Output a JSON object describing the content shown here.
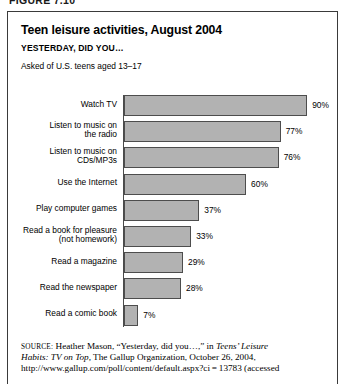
{
  "figure_number": "FIGURE 7.10",
  "figure": {
    "title": "Teen leisure activities, August 2004",
    "subtitle": "YESTERDAY, DID YOU…",
    "asked_note": "Asked of U.S. teens aged 13–17"
  },
  "chart_data": {
    "type": "bar",
    "orientation": "horizontal",
    "title": "Teen leisure activities, August 2004",
    "subtitle": "YESTERDAY, DID YOU…",
    "xlabel": "",
    "ylabel": "",
    "xlim": [
      0,
      100
    ],
    "grid": false,
    "legend": null,
    "value_suffix": "%",
    "categories": [
      "Watch TV",
      "Listen to music on the radio",
      "Listen to music on CDs/MP3s",
      "Use the Internet",
      "Play computer games",
      "Read a book for pleasure (not homework)",
      "Read a magazine",
      "Read the newspaper",
      "Read a comic book"
    ],
    "values": [
      90,
      77,
      76,
      60,
      37,
      33,
      29,
      28,
      7
    ],
    "bars": [
      {
        "label_lines": [
          "Watch TV"
        ],
        "value": 90,
        "value_label": "90%"
      },
      {
        "label_lines": [
          "Listen to music on",
          "the radio"
        ],
        "value": 77,
        "value_label": "77%"
      },
      {
        "label_lines": [
          "Listen to music on",
          "CDs/MP3s"
        ],
        "value": 76,
        "value_label": "76%"
      },
      {
        "label_lines": [
          "Use the Internet"
        ],
        "value": 60,
        "value_label": "60%"
      },
      {
        "label_lines": [
          "Play computer games"
        ],
        "value": 37,
        "value_label": "37%"
      },
      {
        "label_lines": [
          "Read a book for pleasure",
          "(not homework)"
        ],
        "value": 33,
        "value_label": "33%"
      },
      {
        "label_lines": [
          "Read a magazine"
        ],
        "value": 29,
        "value_label": "29%"
      },
      {
        "label_lines": [
          "Read the newspaper"
        ],
        "value": 28,
        "value_label": "28%"
      },
      {
        "label_lines": [
          "Read a comic book"
        ],
        "value": 7,
        "value_label": "7%"
      }
    ],
    "colors": {
      "bar_fill": "#b2b2b2",
      "bar_stroke": "#4d4d4d",
      "axis": "#4a4a4a",
      "text": "#000000"
    }
  },
  "source": {
    "label": "SOURCE:",
    "line1_rest": " Heather Mason, “Yesterday, did you…,” in ",
    "italic1": "Teens’ Leisure",
    "italic2": "Habits: TV on Top,",
    "line2_rest": " The Gallup Organization, October 26, 2004,",
    "line3": "http://www.gallup.com/poll/content/default.aspx?ci = 13783 (accessed"
  }
}
